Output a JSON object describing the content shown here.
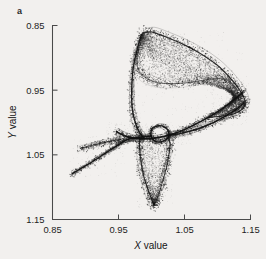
{
  "figure": {
    "panel_label": "a",
    "background_color": "#f2f0ee",
    "ink_color": "#101010"
  },
  "axes": {
    "x_title_italic": "X",
    "x_title_rest": " value",
    "y_title_italic": "Y",
    "y_title_rest": " value",
    "x_ticks": [
      "0.85",
      "0.95",
      "1.05",
      "1.15"
    ],
    "y_ticks": [
      "1.15",
      "1.05",
      "0.95",
      "0.85"
    ]
  },
  "chart_data": {
    "type": "scatter",
    "title": "",
    "subtitle": "",
    "xlabel": "X value",
    "ylabel": "Y value",
    "xlim": [
      0.85,
      1.15
    ],
    "ylim": [
      0.85,
      1.15
    ],
    "xticks": [
      0.85,
      0.95,
      1.05,
      1.15
    ],
    "yticks": [
      0.85,
      0.95,
      1.05,
      1.15
    ],
    "grid": false,
    "legend": null,
    "annotations": [
      {
        "text": "a",
        "position": "top-left-outside"
      }
    ],
    "series": [
      {
        "name": "attractor-filaments",
        "render": "curve",
        "paths": [
          {
            "name": "outer-upper-band",
            "points": [
              [
                0.986,
                1.138
              ],
              [
                1.0,
                1.14
              ],
              [
                1.02,
                1.133
              ],
              [
                1.046,
                1.122
              ],
              [
                1.072,
                1.108
              ],
              [
                1.098,
                1.09
              ],
              [
                1.12,
                1.068
              ],
              [
                1.135,
                1.048
              ],
              [
                1.142,
                1.032
              ],
              [
                1.138,
                1.021
              ],
              [
                1.126,
                1.014
              ],
              [
                1.108,
                1.01
              ],
              [
                1.086,
                1.008
              ]
            ]
          },
          {
            "name": "inner-upper-arc",
            "points": [
              [
                0.982,
                1.12
              ],
              [
                0.978,
                1.1
              ],
              [
                0.98,
                1.082
              ],
              [
                0.99,
                1.07
              ],
              [
                1.008,
                1.062
              ],
              [
                1.032,
                1.06
              ],
              [
                1.058,
                1.062
              ],
              [
                1.082,
                1.066
              ],
              [
                1.104,
                1.068
              ],
              [
                1.12,
                1.062
              ],
              [
                1.13,
                1.048
              ],
              [
                1.132,
                1.034
              ]
            ]
          },
          {
            "name": "left-descending-filament",
            "points": [
              [
                0.985,
                1.136
              ],
              [
                0.978,
                1.112
              ],
              [
                0.972,
                1.082
              ],
              [
                0.97,
                1.05
              ],
              [
                0.971,
                1.02
              ],
              [
                0.976,
                0.998
              ],
              [
                0.982,
                0.984
              ],
              [
                0.988,
                0.977
              ]
            ]
          },
          {
            "name": "central-spike-left",
            "points": [
              [
                0.88,
                0.921
              ],
              [
                0.905,
                0.936
              ],
              [
                0.928,
                0.951
              ],
              [
                0.946,
                0.963
              ],
              [
                0.958,
                0.971
              ],
              [
                0.968,
                0.975
              ],
              [
                0.982,
                0.977
              ],
              [
                1.0,
                0.979
              ]
            ]
          },
          {
            "name": "central-spike-upper",
            "points": [
              [
                0.947,
                0.986
              ],
              [
                0.958,
                0.98
              ],
              [
                0.972,
                0.976
              ],
              [
                0.99,
                0.975
              ],
              [
                1.012,
                0.977
              ],
              [
                1.038,
                0.984
              ],
              [
                1.062,
                0.995
              ],
              [
                1.086,
                1.008
              ],
              [
                1.108,
                1.022
              ],
              [
                1.126,
                1.036
              ],
              [
                1.138,
                1.046
              ]
            ]
          },
          {
            "name": "central-small-loop",
            "points": [
              [
                1.0,
                0.99
              ],
              [
                1.01,
                0.995
              ],
              [
                1.02,
                0.993
              ],
              [
                1.026,
                0.985
              ],
              [
                1.024,
                0.975
              ],
              [
                1.014,
                0.97
              ],
              [
                1.004,
                0.972
              ],
              [
                0.999,
                0.98
              ],
              [
                1.0,
                0.99
              ]
            ]
          },
          {
            "name": "lower-lobe-left",
            "points": [
              [
                0.982,
                0.976
              ],
              [
                0.982,
                0.96
              ],
              [
                0.984,
                0.94
              ],
              [
                0.988,
                0.918
              ],
              [
                0.994,
                0.898
              ],
              [
                1.0,
                0.882
              ],
              [
                1.004,
                0.872
              ]
            ]
          },
          {
            "name": "lower-lobe-right",
            "points": [
              [
                1.004,
                0.872
              ],
              [
                1.01,
                0.886
              ],
              [
                1.016,
                0.906
              ],
              [
                1.022,
                0.928
              ],
              [
                1.026,
                0.948
              ],
              [
                1.028,
                0.966
              ],
              [
                1.026,
                0.98
              ]
            ]
          },
          {
            "name": "right-cusp-return",
            "points": [
              [
                1.14,
                1.03
              ],
              [
                1.128,
                1.02
              ],
              [
                1.112,
                1.01
              ],
              [
                1.092,
                0.999
              ],
              [
                1.07,
                0.99
              ],
              [
                1.048,
                0.984
              ],
              [
                1.028,
                0.98
              ]
            ]
          },
          {
            "name": "secondary-left-spike",
            "points": [
              [
                0.892,
                0.96
              ],
              [
                0.916,
                0.966
              ],
              [
                0.938,
                0.971
              ],
              [
                0.954,
                0.974
              ]
            ]
          }
        ]
      },
      {
        "name": "attractor-stipple-cloud",
        "render": "points",
        "point_count_approx": 2600,
        "density_regions": [
          {
            "name": "upper-band",
            "x_range": [
              0.975,
              1.145
            ],
            "y_range": [
              1.005,
              1.142
            ]
          },
          {
            "name": "central-crossing",
            "x_range": [
              0.93,
              1.06
            ],
            "y_range": [
              0.965,
              1.0
            ]
          },
          {
            "name": "lower-lobe",
            "x_range": [
              0.978,
              1.032
            ],
            "y_range": [
              0.868,
              0.98
            ]
          },
          {
            "name": "left-spike",
            "x_range": [
              0.876,
              0.96
            ],
            "y_range": [
              0.915,
              0.98
            ]
          },
          {
            "name": "right-cusp",
            "x_range": [
              1.09,
              1.148
            ],
            "y_range": [
              0.995,
              1.07
            ]
          }
        ]
      }
    ]
  }
}
